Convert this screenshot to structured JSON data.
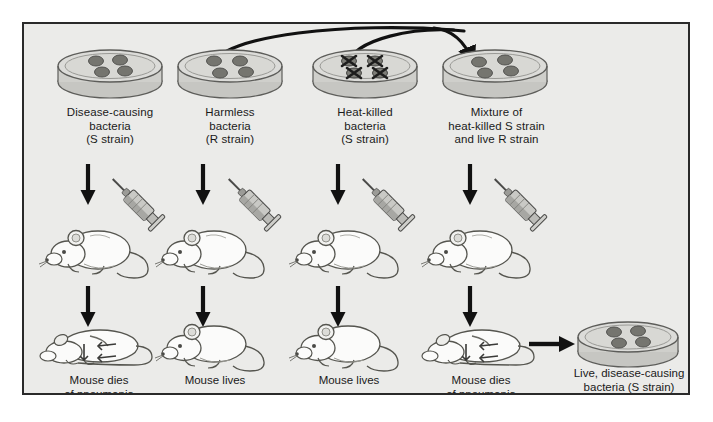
{
  "figure": {
    "background_color": "#ebebe9",
    "border_color": "#2a2a2a"
  },
  "columns": [
    {
      "id": "col-1",
      "dish_label": "Disease-causing\nbacteria\n(S strain)",
      "dish_contents": "round-colonies",
      "colony_count": 4,
      "mouse_state": "alive-injected",
      "outcome_label": "Mouse dies\nof pneumonia",
      "result_mouse_state": "dead"
    },
    {
      "id": "col-2",
      "dish_label": "Harmless\nbacteria\n(R strain)",
      "dish_contents": "round-colonies",
      "colony_count": 4,
      "mouse_state": "alive-injected",
      "outcome_label": "Mouse lives",
      "result_mouse_state": "alive"
    },
    {
      "id": "col-3",
      "dish_label": "Heat-killed\nbacteria\n(S strain)",
      "dish_contents": "x-marked-colonies",
      "colony_count": 4,
      "mouse_state": "alive-injected",
      "outcome_label": "Mouse lives",
      "result_mouse_state": "alive"
    },
    {
      "id": "col-4",
      "dish_label": "Mixture of\nheat-killed S strain\nand live R strain",
      "dish_contents": "round-colonies",
      "colony_count": 4,
      "mouse_state": "alive-injected",
      "outcome_label": "Mouse dies\nof pneumonia",
      "result_mouse_state": "dead"
    }
  ],
  "final_result": {
    "dish_label": "Live, disease-causing\nbacteria (S strain)",
    "colony_count": 4
  },
  "colors": {
    "dish_fill": "#d5d5d2",
    "dish_top": "#dcdcd9",
    "dish_rim": "#8e8e8a",
    "colony": "#6e6e6c",
    "arrow": "#111111",
    "outline": "#3a3a3a",
    "syringe_body": "#bdbdba",
    "mouse_fill": "#fbfbfa"
  },
  "arrows": {
    "curve_from_r_strain": "R strain dish to mixture dish",
    "curve_from_heatkilled": "Heat-killed S dish to mixture dish",
    "down_to_mouse": "dish to injected mouse",
    "down_to_result": "injected mouse to outcome mouse",
    "right_to_final_dish": "dead mouse to recovered bacteria dish"
  }
}
